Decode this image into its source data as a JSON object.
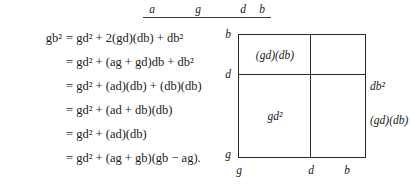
{
  "document": {
    "type": "math-derivation-with-figure",
    "top_ruler": {
      "labels": [
        {
          "text": "a",
          "x": 152,
          "y": 3
        },
        {
          "text": "g",
          "x": 198,
          "y": 3
        },
        {
          "text": "d",
          "x": 243,
          "y": 3
        },
        {
          "text": "b",
          "x": 262,
          "y": 3
        }
      ],
      "rule": {
        "x": 143,
        "width": 128,
        "y": 17
      }
    },
    "equations": [
      {
        "lhs": "gb²",
        "rhs": "= gd² + 2(gd)(db) + db²"
      },
      {
        "lhs": "",
        "rhs": "= gd² + (ag + gd)db + db²"
      },
      {
        "lhs": "",
        "rhs": "= gd² + (ad)(db) + (db)(db)"
      },
      {
        "lhs": "",
        "rhs": "= gd² + (ad + db)(db)"
      },
      {
        "lhs": "",
        "rhs": "= gd² + (ad)(db)"
      },
      {
        "lhs": "",
        "rhs": "= gd² + (ag + gb)(gb − ag)."
      }
    ],
    "figure": {
      "description": "square partitioned into four regions by one vertical and one horizontal line",
      "left_axis_labels": [
        {
          "text": "b",
          "top": 6
        },
        {
          "text": "d",
          "top": 46
        },
        {
          "text": "g",
          "top": 126
        }
      ],
      "bottom_axis_labels": [
        {
          "text": "g",
          "left": 20
        },
        {
          "text": "d",
          "left": 92
        },
        {
          "text": "b",
          "left": 128
        }
      ],
      "inner_labels": [
        {
          "text": "(gd)(db)",
          "left": 56,
          "top": 26
        },
        {
          "text": "gd²",
          "left": 56,
          "top": 88
        }
      ],
      "right_labels": [
        {
          "text": "db²",
          "top": 58
        },
        {
          "text": "(gd)(db)",
          "top": 92
        }
      ]
    }
  },
  "colors": {
    "ink": "#1a1a1a",
    "rule": "#3a3a3a",
    "line": "#2a2a2a",
    "background": "#ffffff"
  }
}
